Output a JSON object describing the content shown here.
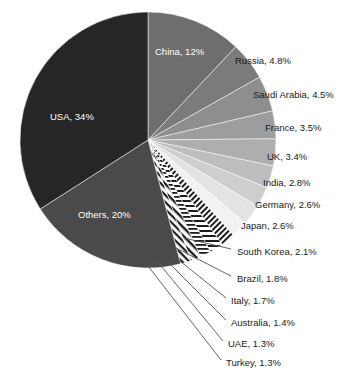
{
  "chart_data": {
    "type": "pie",
    "title": "",
    "subtitle": "",
    "xlabel": "",
    "ylabel": "",
    "legend_position": "none",
    "grid": false,
    "start_angle_deg": 0,
    "direction": "clockwise",
    "total_percent": 100,
    "categories": [
      "China",
      "Russia",
      "Saudi Arabia",
      "France",
      "UK",
      "India",
      "Germany",
      "Japan",
      "South Korea",
      "Brazil",
      "Italy",
      "Australia",
      "UAE",
      "Turkey",
      "Others",
      "USA"
    ],
    "values": [
      12,
      4.8,
      4.5,
      3.5,
      3.4,
      2.8,
      2.6,
      2.6,
      2.1,
      1.8,
      1.7,
      1.4,
      1.3,
      1.3,
      20,
      34
    ],
    "slices": [
      {
        "label": "China, 12%",
        "name": "China",
        "value": 12,
        "color": "#6e6e6e",
        "label_placement": "inside"
      },
      {
        "label": "Russia, 4.8%",
        "name": "Russia",
        "value": 4.8,
        "color": "#7b7b7b",
        "label_placement": "outside"
      },
      {
        "label": "Saudi Arabia, 4.5%",
        "name": "Saudi Arabia",
        "value": 4.5,
        "color": "#8e8e8e",
        "label_placement": "outside"
      },
      {
        "label": "France, 3.5%",
        "name": "France",
        "value": 3.5,
        "color": "#9d9d9d",
        "label_placement": "outside"
      },
      {
        "label": "UK, 3.4%",
        "name": "UK",
        "value": 3.4,
        "color": "#aeaeae",
        "label_placement": "outside"
      },
      {
        "label": "India, 2.8%",
        "name": "India",
        "value": 2.8,
        "color": "#bdbdbd",
        "label_placement": "outside"
      },
      {
        "label": "Germany, 2.6%",
        "name": "Germany",
        "value": 2.6,
        "color": "#cecece",
        "label_placement": "outside"
      },
      {
        "label": "Japan, 2.6%",
        "name": "Japan",
        "value": 2.6,
        "color": "#e3e3e3",
        "label_placement": "outside"
      },
      {
        "label": "South Korea, 2.1%",
        "name": "South Korea",
        "value": 2.1,
        "color": "#f2f2f2",
        "label_placement": "leader"
      },
      {
        "label": "Brazil, 1.8%",
        "name": "Brazil",
        "value": 1.8,
        "color": "#ffffff",
        "label_placement": "leader"
      },
      {
        "label": "Italy, 1.7%",
        "name": "Italy",
        "value": 1.7,
        "color": "#ffffff",
        "label_placement": "leader"
      },
      {
        "label": "Australia, 1.4%",
        "name": "Australia",
        "value": 1.4,
        "color": "#ffffff",
        "label_placement": "leader"
      },
      {
        "label": "UAE, 1.3%",
        "name": "UAE",
        "value": 1.3,
        "color": "#ffffff",
        "label_placement": "leader"
      },
      {
        "label": "Turkey, 1.3%",
        "name": "Turkey",
        "value": 1.3,
        "color": "#ffffff",
        "label_placement": "leader"
      },
      {
        "label": "Others, 20%",
        "name": "Others",
        "value": 20,
        "color": "#4a4a4a",
        "label_placement": "inside"
      },
      {
        "label": "USA, 34%",
        "name": "USA",
        "value": 34,
        "color": "#262626",
        "label_placement": "inside"
      }
    ]
  },
  "geometry": {
    "cx": 148,
    "cy": 140,
    "r": 128
  },
  "labels_outer": [
    {
      "key": "russia",
      "text": "Russia, 4.8%",
      "x": 235,
      "y": 61
    },
    {
      "key": "saudi-arabia",
      "text": "Saudi Arabia, 4.5%",
      "x": 253,
      "y": 95
    },
    {
      "key": "france",
      "text": "France, 3.5%",
      "x": 265,
      "y": 128
    },
    {
      "key": "uk",
      "text": "UK, 3.4%",
      "x": 267,
      "y": 157
    },
    {
      "key": "india",
      "text": "India, 2.8%",
      "x": 263,
      "y": 183
    },
    {
      "key": "germany",
      "text": "Germany, 2.6%",
      "x": 255,
      "y": 205
    },
    {
      "key": "japan",
      "text": "Japan, 2.6%",
      "x": 241,
      "y": 226
    }
  ],
  "labels_leader": [
    {
      "key": "south-korea",
      "text": "South Korea, 2.1%",
      "x": 237,
      "y": 252,
      "lx1": 184,
      "ly1": 238,
      "lx2": 231,
      "ly2": 249
    },
    {
      "key": "brazil",
      "text": "Brazil, 1.8%",
      "x": 237,
      "y": 279,
      "lx1": 176,
      "ly1": 248,
      "lx2": 231,
      "ly2": 276
    },
    {
      "key": "italy",
      "text": "Italy, 1.7%",
      "x": 231,
      "y": 301,
      "lx1": 170,
      "ly1": 253,
      "lx2": 226,
      "ly2": 298
    },
    {
      "key": "australia",
      "text": "Australia, 1.4%",
      "x": 231,
      "y": 323,
      "lx1": 163,
      "ly1": 257,
      "lx2": 226,
      "ly2": 320
    },
    {
      "key": "uae",
      "text": "UAE, 1.3%",
      "x": 228,
      "y": 344,
      "lx1": 157,
      "ly1": 261,
      "lx2": 223,
      "ly2": 341
    },
    {
      "key": "turkey",
      "text": "Turkey, 1.3%",
      "x": 226,
      "y": 363,
      "lx1": 148,
      "ly1": 266,
      "lx2": 221,
      "ly2": 360
    }
  ],
  "labels_inner": [
    {
      "key": "china",
      "text": "China, 12%",
      "x": 155,
      "y": 52
    },
    {
      "key": "usa",
      "text": "USA, 34%",
      "x": 50,
      "y": 117
    },
    {
      "key": "others",
      "text": "Others, 20%",
      "x": 78,
      "y": 215
    }
  ]
}
